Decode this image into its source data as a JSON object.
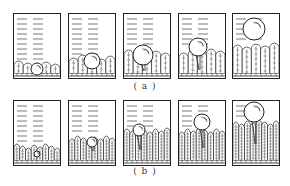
{
  "figure": {
    "stroke_color": "#222222",
    "background": "#ffffff",
    "rows": [
      {
        "id": "a",
        "caption": "( a )",
        "panels": [
          {
            "stage": 1,
            "bubble_r": 6,
            "bubble_cy": 56,
            "bubble_cx": 24,
            "neck": 0,
            "growth": 1
          },
          {
            "stage": 2,
            "bubble_r": 8,
            "bubble_cy": 48,
            "bubble_cx": 24,
            "neck": 0,
            "growth": 2
          },
          {
            "stage": 3,
            "bubble_r": 10,
            "bubble_cy": 42,
            "bubble_cx": 20,
            "neck": 6,
            "growth": 3
          },
          {
            "stage": 4,
            "bubble_r": 9,
            "bubble_cy": 34,
            "bubble_cx": 20,
            "neck": 14,
            "growth": 3
          },
          {
            "stage": 5,
            "bubble_r": 11,
            "bubble_cy": 16,
            "bubble_cx": 22,
            "neck": 0,
            "growth": 4
          }
        ]
      },
      {
        "id": "b",
        "caption": "( b )",
        "panels": [
          {
            "stage": 1,
            "bubble_r": 3,
            "bubble_cy": 54,
            "bubble_cx": 24,
            "neck": 0,
            "growth": 1
          },
          {
            "stage": 2,
            "bubble_r": 5,
            "bubble_cy": 42,
            "bubble_cx": 24,
            "neck": 4,
            "growth": 2
          },
          {
            "stage": 3,
            "bubble_r": 6,
            "bubble_cy": 30,
            "bubble_cx": 16,
            "neck": 14,
            "growth": 3
          },
          {
            "stage": 4,
            "bubble_r": 8,
            "bubble_cy": 22,
            "bubble_cx": 24,
            "neck": 18,
            "growth": 3
          },
          {
            "stage": 5,
            "bubble_r": 10,
            "bubble_cy": 12,
            "bubble_cx": 22,
            "neck": 22,
            "growth": 4
          }
        ]
      }
    ]
  }
}
